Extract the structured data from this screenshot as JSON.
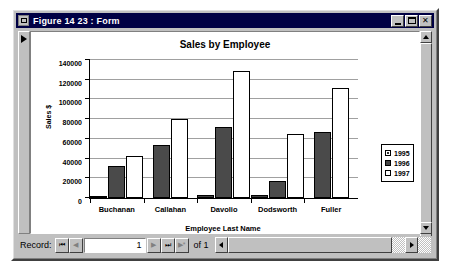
{
  "window": {
    "title": "Figure 14 23 : Form",
    "sysmenu_icon": "system-menu-icon",
    "minimize_label": "",
    "maximize_label": "",
    "close_label": "✕"
  },
  "navbar": {
    "record_label": "Record:",
    "first_label": "⏮",
    "prev_label": "◀",
    "value": "1",
    "next_label": "▶",
    "last_label": "⏭",
    "new_label": "▶*",
    "of_label": "of 1"
  },
  "scrollbars": {
    "v_up": "▲",
    "v_down": "▼",
    "h_left": "◀",
    "h_right": "▶"
  },
  "chart_data": {
    "type": "bar",
    "title": "Sales by Employee",
    "xlabel": "Employee Last Name",
    "ylabel": "Sales $",
    "categories": [
      "Buchanan",
      "Callahan",
      "Davolio",
      "Dodsworth",
      "Fuller"
    ],
    "series": [
      {
        "name": "1995",
        "color": "#404040",
        "values": [
          1000,
          0,
          3000,
          3000,
          0
        ]
      },
      {
        "name": "1996",
        "color": "#4a4a4a",
        "values": [
          32000,
          54000,
          72000,
          17000,
          67000
        ]
      },
      {
        "name": "1997",
        "color": "#ffffff",
        "values": [
          43000,
          80000,
          129000,
          65000,
          112000
        ]
      }
    ],
    "ylim": [
      0,
      140000
    ],
    "yticks": [
      0,
      20000,
      40000,
      60000,
      80000,
      100000,
      120000,
      140000
    ],
    "grid": true,
    "legend_position": "right"
  }
}
